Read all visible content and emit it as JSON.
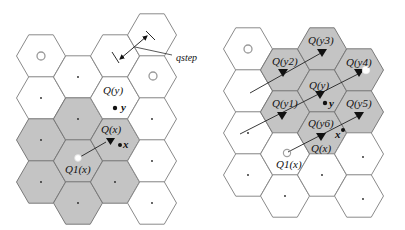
{
  "figure": {
    "left_panel": {
      "name": "single-quantization",
      "labels": {
        "qstep": "qstep",
        "q_y": "Q(y)",
        "y": "y",
        "q_x": "Q(x)",
        "x": "x",
        "q1_x": "Q1(x)"
      }
    },
    "right_panel": {
      "name": "neighbor-quantization",
      "labels": {
        "q_y1": "Q(y1)",
        "q_y2": "Q(y2)",
        "q_y3": "Q(y3)",
        "q_y4": "Q(y4)",
        "q_y5": "Q(y5)",
        "q_y6": "Q(y6)",
        "q_y": "Q(y)",
        "y": "y",
        "q_x": "Q(x)",
        "x": "x",
        "q1_x": "Q1(x)"
      }
    },
    "colors": {
      "cell_white": "#ffffff",
      "cell_grey": "#c4c4c4",
      "cell_stroke": "#8a8a8a",
      "ring": "#9a9a9a",
      "ink": "#111111"
    }
  }
}
